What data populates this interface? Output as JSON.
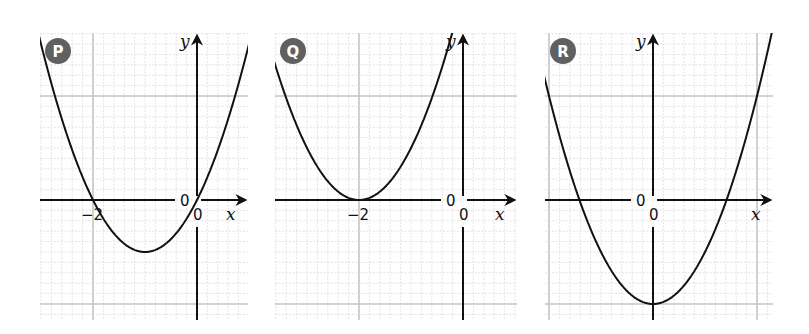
{
  "chart_data": [
    {
      "type": "line",
      "title": "P",
      "equation": "y = x^2 + 2x",
      "x_axis_label": "x",
      "y_axis_label": "y",
      "tick_labels": [
        "-2",
        "0",
        "0"
      ],
      "origin_labels": [
        "0",
        "0"
      ],
      "xlim": [
        -3,
        1
      ],
      "ylim": [
        -2.3,
        3.2
      ],
      "grid": true,
      "key_points": {
        "roots": [
          -2,
          0
        ],
        "vertex": [
          -1,
          -1
        ]
      },
      "coef": [
        1,
        2,
        0
      ]
    },
    {
      "type": "line",
      "title": "Q",
      "equation": "y = (x + 2)^2",
      "x_axis_label": "x",
      "y_axis_label": "y",
      "tick_labels": [
        "-2"
      ],
      "origin_labels": [
        "0",
        "0"
      ],
      "xlim": [
        -3.6,
        0.9
      ],
      "ylim": [
        -2.3,
        3.2
      ],
      "grid": true,
      "key_points": {
        "roots": [
          -2
        ],
        "vertex": [
          -2,
          0
        ]
      },
      "coef": [
        1,
        4,
        4
      ]
    },
    {
      "type": "line",
      "title": "R",
      "equation": "y = x^2 - 2",
      "x_axis_label": "x",
      "y_axis_label": "y",
      "tick_labels": [],
      "origin_labels": [
        "0",
        "0"
      ],
      "xlim": [
        -2.1,
        2.3
      ],
      "ylim": [
        -2.3,
        3.2
      ],
      "grid": true,
      "key_points": {
        "roots": [
          -1.414,
          1.414
        ],
        "vertex": [
          0,
          -2
        ]
      },
      "coef": [
        1,
        0,
        -2
      ]
    }
  ]
}
